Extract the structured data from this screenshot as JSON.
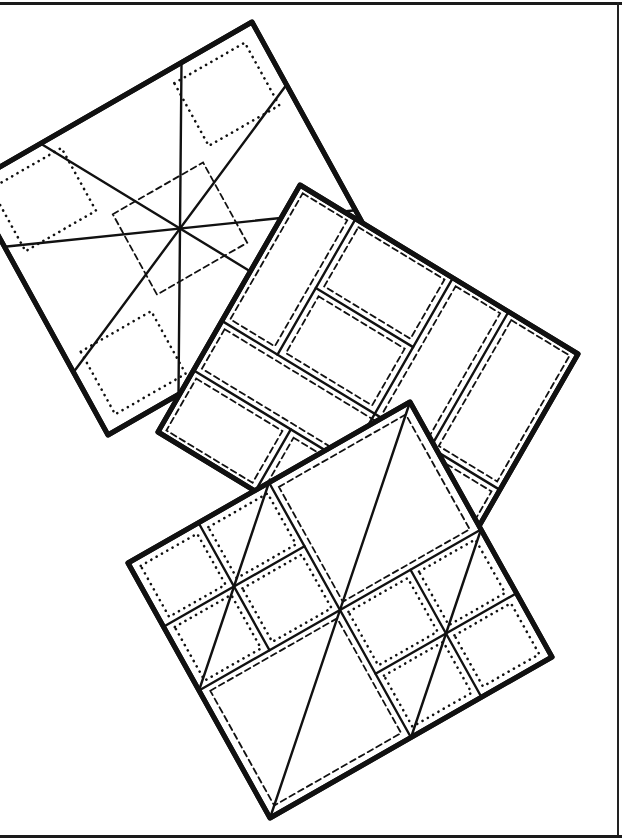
{
  "illustration": {
    "subject": "three overlapping rotated quilt blocks, line drawing",
    "ink_color": "#111111",
    "paper_color": "#ffffff",
    "frame": {
      "top": true,
      "right": true,
      "bottom": true,
      "left": false,
      "color": "#1a1a1a"
    }
  },
  "blocks": [
    {
      "name": "quilt-block-star",
      "origin": [
        -30,
        184
      ],
      "u": [
        282,
        -162
      ],
      "v": [
        138,
        251
      ],
      "solid": [
        [
          0.25,
          0,
          0.75,
          1
        ],
        [
          0.75,
          0,
          0.25,
          1
        ],
        [
          0,
          0.25,
          1,
          0.75
        ],
        [
          0,
          0.75,
          1,
          0.25
        ]
      ],
      "dotted": [
        [
          0.05,
          0.05,
          0.3,
          0.3
        ],
        [
          0.7,
          0.05,
          0.95,
          0.3
        ],
        [
          0.05,
          0.7,
          0.3,
          0.95
        ],
        [
          0.7,
          0.7,
          0.95,
          0.95
        ]
      ],
      "dashed": [
        [
          0.34,
          0.34,
          0.66,
          0.66
        ]
      ]
    },
    {
      "name": "quilt-block-rails",
      "origin": [
        300,
        185
      ],
      "u": [
        278,
        169
      ],
      "v": [
        -142,
        247
      ],
      "solid": [
        [
          0.2,
          0,
          0.2,
          0.55
        ],
        [
          0.2,
          0.28,
          0.55,
          0.28
        ],
        [
          0.55,
          0,
          0.55,
          1
        ],
        [
          0.75,
          0,
          0.75,
          0.55
        ],
        [
          0,
          0.55,
          1,
          0.55
        ],
        [
          0,
          0.75,
          1,
          0.75
        ],
        [
          0.35,
          0.75,
          0.35,
          1
        ]
      ],
      "dashed": [
        [
          0.02,
          0.02,
          0.18,
          0.53
        ],
        [
          0.22,
          0.02,
          0.53,
          0.26
        ],
        [
          0.22,
          0.3,
          0.53,
          0.53
        ],
        [
          0.57,
          0.02,
          0.73,
          0.53
        ],
        [
          0.77,
          0.02,
          0.98,
          0.53
        ],
        [
          0.02,
          0.57,
          0.98,
          0.73
        ],
        [
          0.02,
          0.77,
          0.33,
          0.98
        ],
        [
          0.37,
          0.77,
          0.53,
          0.98
        ],
        [
          0.57,
          0.77,
          0.98,
          0.98
        ]
      ],
      "dotted": []
    },
    {
      "name": "quilt-block-variable-star",
      "origin": [
        128,
        563
      ],
      "u": [
        282,
        -161
      ],
      "v": [
        142,
        255
      ],
      "solid": [
        [
          1,
          0,
          0,
          1
        ],
        [
          0.5,
          0,
          0.5,
          1
        ],
        [
          0,
          0.5,
          1,
          0.5
        ],
        [
          0.5,
          0,
          0,
          0.5
        ],
        [
          1,
          0.5,
          0.5,
          1
        ],
        [
          0.25,
          0,
          0.25,
          0.5
        ],
        [
          0,
          0.25,
          0.5,
          0.25
        ],
        [
          0.75,
          0.5,
          0.75,
          1
        ],
        [
          0.5,
          0.75,
          1,
          0.75
        ]
      ],
      "dotted": [
        [
          0.03,
          0.03,
          0.23,
          0.23
        ],
        [
          0.27,
          0.03,
          0.48,
          0.23
        ],
        [
          0.03,
          0.27,
          0.23,
          0.48
        ],
        [
          0.27,
          0.27,
          0.48,
          0.48
        ],
        [
          0.52,
          0.52,
          0.73,
          0.73
        ],
        [
          0.77,
          0.52,
          0.97,
          0.73
        ],
        [
          0.52,
          0.77,
          0.73,
          0.97
        ],
        [
          0.77,
          0.77,
          0.97,
          0.97
        ]
      ],
      "dashed": [
        [
          0.52,
          0.03,
          0.97,
          0.48
        ],
        [
          0.03,
          0.52,
          0.48,
          0.97
        ]
      ]
    }
  ]
}
